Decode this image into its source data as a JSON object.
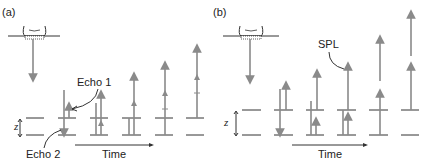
{
  "panels": [
    {
      "id": "a",
      "label": "(a)",
      "annotations": [
        "Echo 1",
        "Echo 2"
      ],
      "axis_label": "Time",
      "depth_label": "z"
    },
    {
      "id": "b",
      "label": "(b)",
      "annotations": [
        "SPL"
      ],
      "axis_label": "Time",
      "depth_label": "z"
    }
  ],
  "colors": {
    "arrow": "#8a8a8a",
    "line": "#333333",
    "text": "#222222"
  }
}
